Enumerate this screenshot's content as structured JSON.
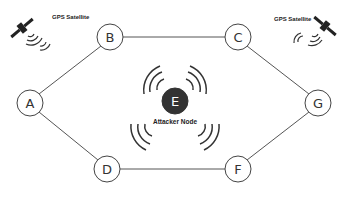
{
  "diagram": {
    "nodes": [
      {
        "id": "A",
        "label": "A",
        "x": 30,
        "y": 103,
        "r": 13,
        "fill": "#ffffff"
      },
      {
        "id": "B",
        "label": "B",
        "x": 110,
        "y": 37,
        "r": 13,
        "fill": "#ffffff"
      },
      {
        "id": "C",
        "label": "C",
        "x": 238,
        "y": 37,
        "r": 13,
        "fill": "#ffffff"
      },
      {
        "id": "D",
        "label": "D",
        "x": 107,
        "y": 169,
        "r": 13,
        "fill": "#ffffff"
      },
      {
        "id": "F",
        "label": "F",
        "x": 238,
        "y": 169,
        "r": 13,
        "fill": "#ffffff"
      },
      {
        "id": "G",
        "label": "G",
        "x": 318,
        "y": 103,
        "r": 13,
        "fill": "#ffffff"
      },
      {
        "id": "E",
        "label": "E",
        "x": 175,
        "y": 101,
        "r": 13,
        "fill": "#333333"
      }
    ],
    "edges": [
      [
        "A",
        "B"
      ],
      [
        "B",
        "C"
      ],
      [
        "C",
        "G"
      ],
      [
        "A",
        "D"
      ],
      [
        "D",
        "F"
      ],
      [
        "F",
        "G"
      ]
    ],
    "attacker_label": "Attacker Node",
    "gps_left_label": "GPS Satellite",
    "gps_right_label": "GPS Satellite"
  }
}
